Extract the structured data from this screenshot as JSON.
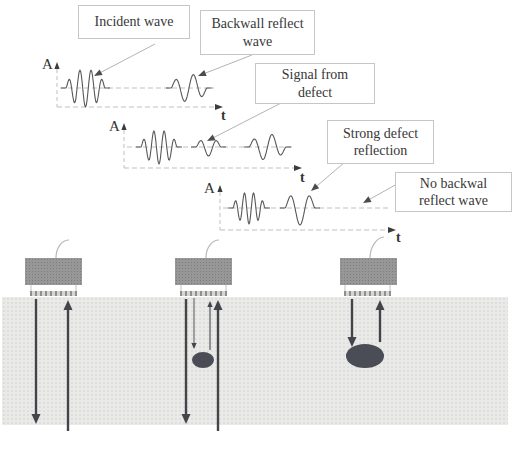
{
  "labels": {
    "amplitude_axis": "A",
    "time_axis": "t"
  },
  "boxes": [
    {
      "name": "incident-wave",
      "lines": [
        "Incident wave"
      ]
    },
    {
      "name": "backwall-reflect-wave",
      "lines": [
        "Backwall reflect",
        "wave"
      ]
    },
    {
      "name": "signal-from-defect",
      "lines": [
        "Signal from",
        "defect"
      ]
    },
    {
      "name": "strong-defect-reflection",
      "lines": [
        "Strong defect",
        "reflection"
      ]
    },
    {
      "name": "no-backwall-reflect-wave",
      "lines": [
        "No backwal",
        "reflect wave"
      ]
    }
  ],
  "colors": {
    "axis_dash": "#bfbfbf",
    "axis_head": "#3c3c3c",
    "wave": "#585858",
    "leader_line": "#b3b3b3",
    "leader_head": "#4c4c4c",
    "beam_arrow": "#43454b",
    "defect": "#4a4d55",
    "cable": "#b8b8b8",
    "leg": "#c2c2c2"
  },
  "art": {
    "plots": [
      {
        "ax": 57,
        "atop": 64,
        "zero_y": 88,
        "zero_x0": 60,
        "zero_x1": 214,
        "t_y": 107,
        "t_x1": 216,
        "waves": [
          {
            "label": "incident wave",
            "x0": 66,
            "x1": 105,
            "half_cycles": 7,
            "amp": 19
          },
          {
            "label": "backwall reflect wave",
            "x0": 171,
            "x1": 207,
            "half_cycles": 4,
            "amp": 14
          }
        ]
      },
      {
        "ax": 124,
        "atop": 125,
        "zero_y": 147,
        "zero_x0": 127,
        "zero_x1": 294,
        "t_y": 168,
        "t_x1": 295,
        "waves": [
          {
            "label": "incident wave",
            "x0": 141,
            "x1": 177,
            "half_cycles": 7,
            "amp": 17
          },
          {
            "label": "signal from defect",
            "x0": 196,
            "x1": 221,
            "half_cycles": 3,
            "amp": 9
          },
          {
            "label": "backwall reflect wave",
            "x0": 249,
            "x1": 286,
            "half_cycles": 4,
            "amp": 13
          }
        ]
      },
      {
        "ax": 220,
        "atop": 187,
        "zero_y": 208,
        "zero_x0": 223,
        "zero_x1": 388,
        "t_y": 230,
        "t_x1": 389,
        "waves": [
          {
            "label": "incident wave",
            "x0": 233,
            "x1": 265,
            "half_cycles": 7,
            "amp": 16
          },
          {
            "label": "strong defect reflection",
            "x0": 285,
            "x1": 315,
            "half_cycles": 3,
            "amp": 17
          }
        ]
      }
    ],
    "leaders": [
      {
        "x1": 155,
        "y1": 44,
        "x2": 94,
        "y2": 76
      },
      {
        "x1": 252,
        "y1": 55,
        "x2": 198,
        "y2": 76
      },
      {
        "x1": 283,
        "y1": 102,
        "x2": 207,
        "y2": 141
      },
      {
        "x1": 345,
        "y1": 162,
        "x2": 311,
        "y2": 191
      },
      {
        "x1": 397,
        "y1": 184,
        "x2": 363,
        "y2": 203
      }
    ],
    "specimens": [
      {
        "cable": [
          56,
          258,
          69,
          240
        ],
        "legs": [
          31,
          76
        ],
        "arrows": [
          {
            "x": 36,
            "from": 299,
            "to": 424,
            "dir": "down",
            "w": 2.4
          },
          {
            "x": 68,
            "from": 431,
            "to": 300,
            "dir": "up",
            "w": 2.4
          }
        ],
        "defect": null
      },
      {
        "cable": [
          206,
          258,
          219,
          240
        ],
        "legs": [
          181,
          226
        ],
        "arrows": [
          {
            "x": 186,
            "from": 299,
            "to": 424,
            "dir": "down",
            "w": 2.4
          },
          {
            "x": 194,
            "from": 298,
            "to": 349,
            "dir": "down",
            "w": 0.9
          },
          {
            "x": 210,
            "from": 350,
            "to": 301,
            "dir": "up",
            "w": 1.1
          },
          {
            "x": 218,
            "from": 431,
            "to": 300,
            "dir": "up",
            "w": 2.4
          }
        ],
        "defect": {
          "cx": 203,
          "cy": 360,
          "rx": 11,
          "ry": 8
        }
      },
      {
        "cable": [
          370,
          258,
          384,
          237
        ],
        "legs": [
          345,
          390
        ],
        "arrows": [
          {
            "x": 352,
            "from": 299,
            "to": 347,
            "dir": "down",
            "w": 2.4
          },
          {
            "x": 380,
            "from": 342,
            "to": 300,
            "dir": "up",
            "w": 2.4
          }
        ],
        "defect": {
          "cx": 365,
          "cy": 356,
          "rx": 19,
          "ry": 12
        }
      }
    ]
  }
}
